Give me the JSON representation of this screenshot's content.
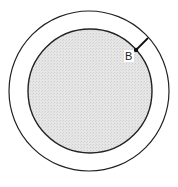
{
  "diagram": {
    "title": "",
    "outer_circle": {
      "cx": 89,
      "cy": 91,
      "r": 80,
      "stroke": "#222222",
      "fill": "none"
    },
    "inner_circle": {
      "cx": 90,
      "cy": 91,
      "r": 62,
      "stroke": "#222222",
      "fill": "#e2e2e2"
    },
    "center_point": {
      "cx": 90,
      "cy": 92
    },
    "point_b": {
      "label": "B",
      "x": 136,
      "y": 50
    },
    "segment": {
      "x1": 136,
      "y1": 50,
      "x2": 148,
      "y2": 38
    },
    "colors": {
      "stroke": "#222222",
      "shading": "#e2e2e2",
      "background": "#ffffff"
    }
  }
}
